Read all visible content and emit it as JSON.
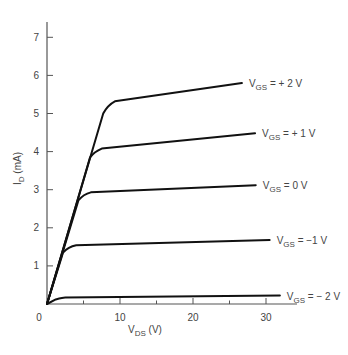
{
  "chart_data": {
    "type": "line",
    "title": "",
    "xlabel": "V_DS (V)",
    "xlabel_main": "V",
    "xlabel_sub": "DS",
    "xlabel_unit": " (V)",
    "ylabel": "I_D (mA)",
    "ylabel_main": "I",
    "ylabel_sub": "D",
    "ylabel_unit": " (mA)",
    "xlim": [
      0,
      34
    ],
    "ylim": [
      0,
      7.5
    ],
    "x_ticks": [
      0,
      10,
      20,
      30
    ],
    "x_minor_ticks": [
      5,
      15,
      25
    ],
    "y_ticks": [
      1,
      2,
      3,
      4,
      5,
      6,
      7
    ],
    "origin_label": "0",
    "grid": false,
    "legend": "inline labels at right end of each curve",
    "series": [
      {
        "name": "V_GS = +2 V",
        "label_main": "V",
        "label_sub": "GS",
        "label_rest": " = + 2 V",
        "points": [
          [
            0,
            0
          ],
          [
            7.7,
            5.0
          ],
          [
            8.3,
            5.22
          ],
          [
            9.3,
            5.32
          ],
          [
            26.7,
            5.8
          ]
        ]
      },
      {
        "name": "V_GS = +1 V",
        "label_main": "V",
        "label_sub": "GS",
        "label_rest": " = + 1 V",
        "points": [
          [
            0,
            0
          ],
          [
            5.9,
            3.85
          ],
          [
            6.5,
            4.0
          ],
          [
            7.5,
            4.08
          ],
          [
            28.5,
            4.48
          ]
        ]
      },
      {
        "name": "V_GS = 0 V",
        "label_main": "V",
        "label_sub": "GS",
        "label_rest": " = 0 V",
        "points": [
          [
            0,
            0
          ],
          [
            4.3,
            2.72
          ],
          [
            5.0,
            2.88
          ],
          [
            6.0,
            2.93
          ],
          [
            28.6,
            3.12
          ]
        ]
      },
      {
        "name": "V_GS = -1 V",
        "label_main": "V",
        "label_sub": "GS",
        "label_rest": " = −1 V",
        "points": [
          [
            0,
            0
          ],
          [
            2.2,
            1.35
          ],
          [
            2.9,
            1.5
          ],
          [
            4.0,
            1.54
          ],
          [
            30.5,
            1.68
          ]
        ]
      },
      {
        "name": "V_GS = -2 V",
        "label_main": "V",
        "label_sub": "GS",
        "label_rest": " = − 2 V",
        "points": [
          [
            0,
            0
          ],
          [
            1.2,
            0.12
          ],
          [
            2.5,
            0.17
          ],
          [
            31.9,
            0.22
          ]
        ]
      }
    ],
    "colors": {
      "curve": "#111111",
      "axis": "#555555",
      "text": "#444444"
    }
  }
}
